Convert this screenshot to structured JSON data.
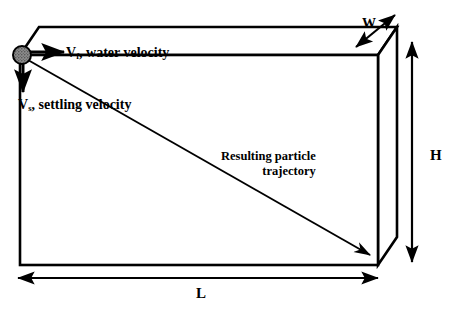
{
  "figure": {
    "background_color": "#ffffff",
    "line_color": "#000000",
    "particle_color": "#808080"
  },
  "labels": {
    "water_velocity": {
      "symbol": "V",
      "subscript": "f",
      "text": ", water velocity"
    },
    "settling_velocity": {
      "symbol": "V",
      "subscript": "s",
      "text": ", settling velocity"
    },
    "trajectory_line1": "Resulting particle",
    "trajectory_line2": "trajectory",
    "width": "W",
    "height": "H",
    "length": "L"
  },
  "geometry": {
    "front_face": {
      "left": 20,
      "top": 55,
      "right": 378,
      "bottom": 265
    },
    "depth_offset": {
      "x": 19,
      "y": -28
    },
    "particle": {
      "cx": 22,
      "cy": 55,
      "r": 9
    },
    "water_velocity_arrow": {
      "x1": 30,
      "y1": 52,
      "x2": 66,
      "y2": 52
    },
    "settling_velocity_arrow": {
      "x1": 23,
      "y1": 64,
      "x2": 23,
      "y2": 95
    },
    "trajectory_arrow": {
      "x1": 28,
      "y1": 60,
      "x2": 370,
      "y2": 255
    },
    "width_dimension": {
      "x1": 355,
      "y1": 46,
      "x2": 396,
      "y2": 14
    },
    "height_dimension": {
      "x1": 412,
      "y1": 42,
      "x2": 412,
      "y2": 262
    },
    "length_dimension": {
      "x1": 18,
      "y1": 278,
      "x2": 378,
      "y2": 278
    }
  }
}
